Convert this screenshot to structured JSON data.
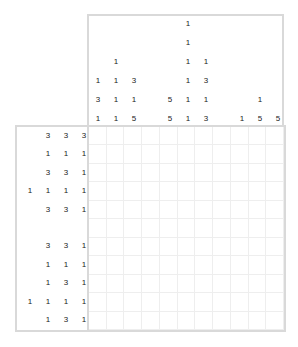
{
  "puzzle": {
    "type": "nonogram",
    "rows": 11,
    "cols": 11,
    "column_clues": [
      [
        "1",
        "3",
        "1"
      ],
      [
        "1",
        "1",
        "1",
        "1"
      ],
      [
        "3",
        "1",
        "5"
      ],
      [],
      [
        "5",
        "5"
      ],
      [
        "1",
        "1",
        "1",
        "1",
        "1",
        "1"
      ],
      [
        "1",
        "3",
        "1",
        "3"
      ],
      [],
      [
        "1"
      ],
      [
        "1",
        "5"
      ],
      [
        "5"
      ]
    ],
    "row_clues": [
      [
        "3",
        "3",
        "3"
      ],
      [
        "1",
        "1",
        "1"
      ],
      [
        "3",
        "3",
        "1"
      ],
      [
        "1",
        "1",
        "1",
        "1"
      ],
      [
        "3",
        "3",
        "1"
      ],
      [],
      [
        "3",
        "3",
        "1"
      ],
      [
        "1",
        "1",
        "1"
      ],
      [
        "1",
        "3",
        "1"
      ],
      [
        "1",
        "1",
        "1",
        "1"
      ],
      [
        "1",
        "3",
        "1"
      ]
    ]
  }
}
